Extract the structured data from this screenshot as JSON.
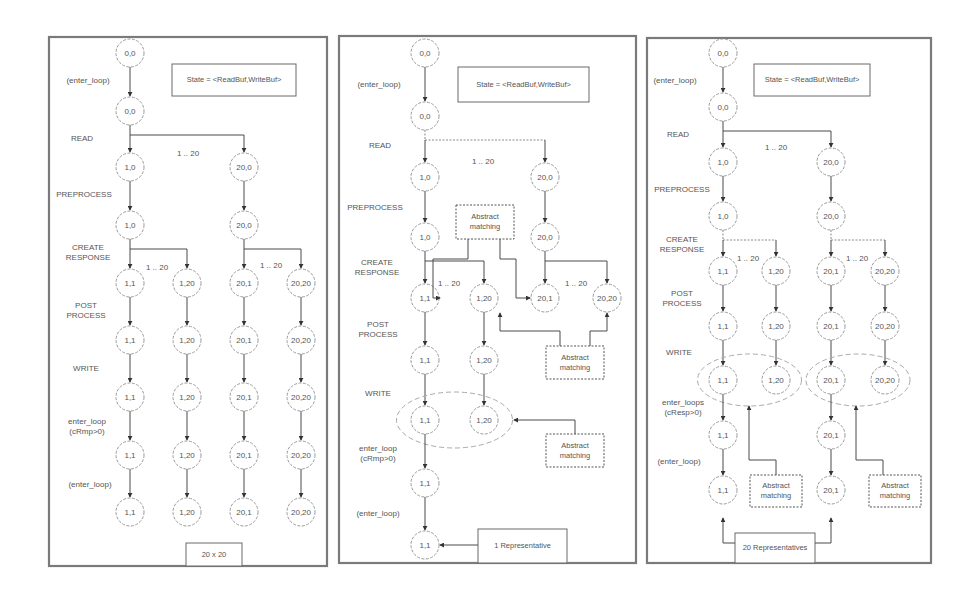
{
  "figure": {
    "panels": [
      {
        "id": "full-20x20",
        "frame": {
          "x": 49,
          "y": 37,
          "w": 278,
          "h": 529
        },
        "state_box": {
          "text": "State = <ReadBuf,WriteBuf>",
          "x": 172,
          "y": 64,
          "w": 124,
          "h": 32
        },
        "bottom_box": {
          "text": "20 x 20",
          "x": 186,
          "y": 543,
          "w": 56,
          "h": 23
        },
        "columns_x": [
          130,
          187,
          244,
          301
        ],
        "rows_y": [
          53,
          111,
          167,
          225,
          283,
          340,
          397,
          455,
          512
        ],
        "step_labels": [
          {
            "lines": [
              "(enter_loop)"
            ],
            "x": 88,
            "y": 83
          },
          {
            "lines": [
              "READ"
            ],
            "x": 82,
            "y": 141
          },
          {
            "lines": [
              "PREPROCESS"
            ],
            "x": 84,
            "y": 197
          },
          {
            "lines": [
              "CREATE",
              "RESPONSE"
            ],
            "x": 88,
            "y": 250
          },
          {
            "lines": [
              "POST",
              "PROCESS"
            ],
            "x": 86,
            "y": 308
          },
          {
            "lines": [
              "WRITE"
            ],
            "x": 86,
            "y": 371
          },
          {
            "lines": [
              "enter_loop",
              "(cRmp>0)"
            ],
            "x": 87,
            "y": 424
          },
          {
            "lines": [
              "(enter_loop)"
            ],
            "x": 90,
            "y": 487
          }
        ],
        "range_labels": [
          {
            "text": "1 .. 20",
            "x": 188,
            "y": 156
          },
          {
            "text": "1 .. 20",
            "x": 157,
            "y": 270
          },
          {
            "text": "1 .. 20",
            "x": 271,
            "y": 268
          }
        ]
      },
      {
        "id": "abstracted-1",
        "frame": {
          "x": 339,
          "y": 36,
          "w": 297,
          "h": 527
        },
        "state_box": {
          "text": "State = <ReadBuf,WriteBuf>",
          "x": 458,
          "y": 67,
          "w": 131,
          "h": 35
        },
        "bottom_box": {
          "text": "1 Representative",
          "x": 478,
          "y": 529,
          "w": 89,
          "h": 34
        },
        "columns_x": [
          425,
          484,
          545,
          607
        ],
        "rows_y": [
          53,
          116,
          177,
          237,
          298,
          360,
          420,
          483,
          545
        ],
        "step_labels": [
          {
            "lines": [
              "(enter_loop)"
            ],
            "x": 379,
            "y": 87
          },
          {
            "lines": [
              "READ"
            ],
            "x": 380,
            "y": 148
          },
          {
            "lines": [
              "PREPROCESS"
            ],
            "x": 375,
            "y": 210
          },
          {
            "lines": [
              "CREATE",
              "RESPONSE"
            ],
            "x": 377,
            "y": 265
          },
          {
            "lines": [
              "POST",
              "PROCESS"
            ],
            "x": 378,
            "y": 327
          },
          {
            "lines": [
              "WRITE"
            ],
            "x": 378,
            "y": 396
          },
          {
            "lines": [
              "enter_loop",
              "(cRmp>0)"
            ],
            "x": 378,
            "y": 451
          },
          {
            "lines": [
              "(enter_loop)"
            ],
            "x": 378,
            "y": 516
          }
        ],
        "range_labels": [
          {
            "text": "1 .. 20",
            "x": 483,
            "y": 164
          },
          {
            "text": "1 .. 20",
            "x": 449,
            "y": 286
          },
          {
            "text": "1 .. 20",
            "x": 576,
            "y": 286
          }
        ],
        "abstract_boxes": [
          {
            "text": [
              "Abstract",
              "matching"
            ],
            "x": 456,
            "y": 205,
            "w": 58,
            "h": 34
          },
          {
            "text": [
              "Abstract",
              "matching"
            ],
            "x": 546,
            "y": 346,
            "w": 58,
            "h": 33
          },
          {
            "text": [
              "Abstract",
              "matching"
            ],
            "x": 546,
            "y": 434,
            "w": 58,
            "h": 33
          }
        ]
      },
      {
        "id": "abstracted-20",
        "frame": {
          "x": 647,
          "y": 38,
          "w": 284,
          "h": 525
        },
        "state_box": {
          "text": "State = <ReadBuf,WriteBuf>",
          "x": 754,
          "y": 64,
          "w": 116,
          "h": 32
        },
        "bottom_box": {
          "text": "20 Representatives",
          "x": 735,
          "y": 533,
          "w": 80,
          "h": 30
        },
        "columns_x": [
          723,
          776,
          831,
          885
        ],
        "rows_y": [
          53,
          107,
          162,
          216,
          271,
          326,
          380,
          435,
          490
        ],
        "step_labels": [
          {
            "lines": [
              "(enter_loop)"
            ],
            "x": 675,
            "y": 83
          },
          {
            "lines": [
              "READ"
            ],
            "x": 678,
            "y": 137
          },
          {
            "lines": [
              "PREPROCESS"
            ],
            "x": 682,
            "y": 192
          },
          {
            "lines": [
              "CREATE",
              "RESPONSE"
            ],
            "x": 682,
            "y": 242
          },
          {
            "lines": [
              "POST",
              "PROCESS"
            ],
            "x": 682,
            "y": 296
          },
          {
            "lines": [
              "WRITE"
            ],
            "x": 679,
            "y": 355
          },
          {
            "lines": [
              "enter_loops",
              "(cResp>0)"
            ],
            "x": 683,
            "y": 405
          },
          {
            "lines": [
              "(enter_loop)"
            ],
            "x": 679,
            "y": 464
          }
        ],
        "range_labels": [
          {
            "text": "1 .. 20",
            "x": 776,
            "y": 150
          },
          {
            "text": "1 .. 20",
            "x": 748,
            "y": 261
          },
          {
            "text": "1 .. 20",
            "x": 857,
            "y": 261
          }
        ],
        "abstract_boxes": [
          {
            "text": [
              "Abstract",
              "matching"
            ],
            "x": 750,
            "y": 475,
            "w": 52,
            "h": 32
          },
          {
            "text": [
              "Abstract",
              "matching"
            ],
            "x": 869,
            "y": 475,
            "w": 52,
            "h": 32
          }
        ]
      }
    ],
    "node_labels": {
      "r0": "0,0",
      "r1": "0,0",
      "r2": [
        "1,0",
        "20,0"
      ],
      "r3": [
        "1,0",
        "20,0"
      ],
      "r_leaf": [
        "1,1",
        "1,20",
        "20,1",
        "20,20"
      ],
      "p2_tail": [
        "1,1",
        "1,1"
      ],
      "p3_tail": [
        "1,1",
        "20,1"
      ]
    }
  }
}
